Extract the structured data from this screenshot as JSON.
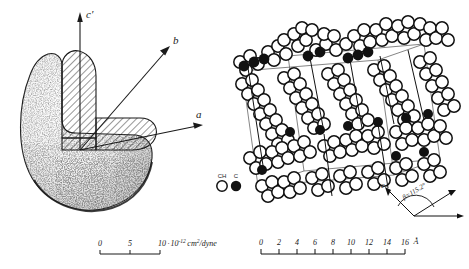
{
  "figure": {
    "panels": [
      {
        "id": "elastic-compliance-body",
        "axes": [
          {
            "name": "c-prime-axis",
            "label": "c′"
          },
          {
            "name": "b-axis",
            "label": "b"
          },
          {
            "name": "a-axis",
            "label": "a"
          }
        ],
        "scale_bar": {
          "ticks": [
            "0",
            "5",
            "10"
          ],
          "tick_values": [
            0,
            5,
            10
          ],
          "unit_mantissa": "10",
          "unit_sep": "·",
          "unit_base": "10",
          "unit_exponent": "-12",
          "unit_rest": "cm",
          "unit_rest_sup": "2",
          "unit_tail": "/dyne",
          "full_text": "10·10⁻¹² cm²/dyne"
        }
      },
      {
        "id": "crystal-packing-diagram",
        "legend": [
          {
            "name": "ch-group",
            "label": "CH",
            "marker": "open-circle"
          },
          {
            "name": "carbon-atom",
            "label": "C",
            "marker": "filled-circle"
          }
        ],
        "angle_annotation": {
          "symbol": "β",
          "equals": "=",
          "value": "115.2",
          "degree": "°",
          "full_text": "β=115.2°"
        },
        "axis_label": {
          "name": "c-axis",
          "label": "c"
        },
        "scale_bar": {
          "ticks": [
            "0",
            "2",
            "4",
            "6",
            "8",
            "10",
            "12",
            "14",
            "16"
          ],
          "tick_values": [
            0,
            2,
            4,
            6,
            8,
            10,
            12,
            14,
            16
          ],
          "unit": "Å"
        }
      }
    ]
  },
  "colors": {
    "ink": "#1a1a1a",
    "line": "#2b2b2b",
    "stipple": "#3a3a3a",
    "background": "#ffffff",
    "cell_line": "#555555"
  }
}
